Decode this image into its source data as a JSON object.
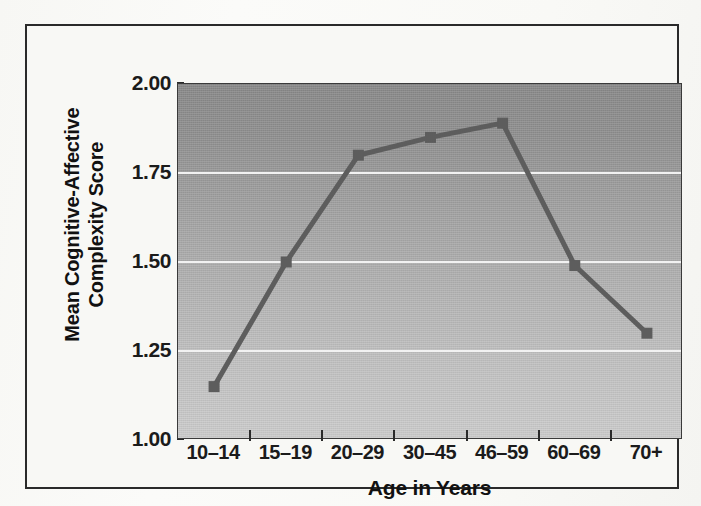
{
  "figure": {
    "frame_border_color": "#2a2a2a",
    "page_background": "#f8f8f5"
  },
  "chart_data": {
    "type": "line",
    "title": "",
    "xlabel": "Age in Years",
    "ylabel": "Mean Cognitive-Affective Complexity Score",
    "ylabel_lines": [
      "Mean Cognitive-Affective",
      "Complexity Score"
    ],
    "categories": [
      "10–14",
      "15–19",
      "20–29",
      "30–45",
      "46–59",
      "60–69",
      "70+"
    ],
    "values": [
      1.15,
      1.5,
      1.8,
      1.85,
      1.89,
      1.49,
      1.3
    ],
    "ylim": [
      1.0,
      2.0
    ],
    "yticks": [
      1.0,
      1.25,
      1.5,
      1.75,
      2.0
    ],
    "ytick_labels": [
      "1.00",
      "1.25",
      "1.50",
      "1.75",
      "2.00"
    ],
    "gridlines_y": [
      1.25,
      1.5,
      1.75
    ],
    "grid": true,
    "grid_color": "#f2f2f2",
    "legend": "none",
    "series_color": "#5d5d5d",
    "marker": "square",
    "marker_size": 11,
    "plot_background_top": "#888888",
    "plot_background_bottom": "#cbcbcb"
  }
}
